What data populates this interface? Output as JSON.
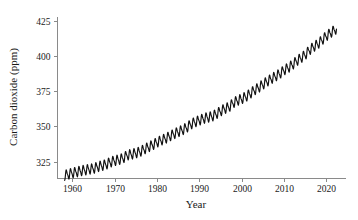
{
  "chart_data": {
    "type": "line",
    "title": "",
    "xlabel": "Year",
    "ylabel": "Carbon dioxide (ppm)",
    "xlim": [
      1956.5,
      2024.5
    ],
    "ylim": [
      313,
      428
    ],
    "xticks": [
      1960,
      1970,
      1980,
      1990,
      2000,
      2010,
      2020
    ],
    "yticks": [
      325,
      350,
      375,
      400,
      425
    ],
    "xtick_labels": [
      "1960",
      "1970",
      "1980",
      "1990",
      "2000",
      "2010",
      "2020"
    ],
    "ytick_labels": [
      "325",
      "350",
      "375",
      "400",
      "425"
    ],
    "grid": false,
    "legend": null,
    "line_color": "#111111",
    "axis_color": "#8a8a8a",
    "background": "#ffffff",
    "series_name": "Atmospheric CO2 (Mauna Loa monthly mean)",
    "seasonal_amplitude_ppm": 6.2,
    "x": [
      1958.2,
      1959,
      1960,
      1961,
      1962,
      1963,
      1964,
      1965,
      1966,
      1967,
      1968,
      1969,
      1970,
      1971,
      1972,
      1973,
      1974,
      1975,
      1976,
      1977,
      1978,
      1979,
      1980,
      1981,
      1982,
      1983,
      1984,
      1985,
      1986,
      1987,
      1988,
      1989,
      1990,
      1991,
      1992,
      1993,
      1994,
      1995,
      1996,
      1997,
      1998,
      1999,
      2000,
      2001,
      2002,
      2003,
      2004,
      2005,
      2006,
      2007,
      2008,
      2009,
      2010,
      2011,
      2012,
      2013,
      2014,
      2015,
      2016,
      2017,
      2018,
      2019,
      2020,
      2021,
      2022
    ],
    "values": [
      315.3,
      315.98,
      316.91,
      317.64,
      318.45,
      318.99,
      319.62,
      320.04,
      321.38,
      322.16,
      323.04,
      324.62,
      325.68,
      326.32,
      327.45,
      329.68,
      330.18,
      331.11,
      332.04,
      333.83,
      335.4,
      336.84,
      338.75,
      340.11,
      341.45,
      343.05,
      344.65,
      346.12,
      347.42,
      349.19,
      351.57,
      353.12,
      354.39,
      355.61,
      356.45,
      357.1,
      358.83,
      360.82,
      362.61,
      363.73,
      366.7,
      368.38,
      369.55,
      371.14,
      373.28,
      375.8,
      377.52,
      379.8,
      381.9,
      383.79,
      385.6,
      387.43,
      389.9,
      391.65,
      393.85,
      396.52,
      398.65,
      400.83,
      404.24,
      406.55,
      408.52,
      411.44,
      414.24,
      416.45,
      418.56
    ]
  }
}
